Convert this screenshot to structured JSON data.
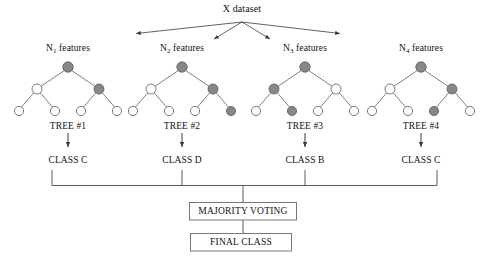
{
  "figure": {
    "title": "X dataset",
    "node_fill_shaded": "#878787",
    "node_fill_empty": "#ffffff",
    "node_stroke": "#5a5a5a",
    "line_color": "#4a4a4a",
    "box_stroke": "#6b6b6b"
  },
  "source": {
    "label": "X dataset",
    "x": 242,
    "y": 11
  },
  "trees": [
    {
      "id": "tree-1",
      "features_label": "N",
      "features_sub": "1",
      "features_suffix": " features",
      "features_x": 68,
      "tree_label": "TREE #1",
      "class_label": "CLASS C",
      "center_x": 68,
      "nodes": {
        "root": "shaded",
        "left": "empty",
        "right": "shaded",
        "leaves": [
          "empty",
          "empty",
          "empty",
          "empty"
        ]
      }
    },
    {
      "id": "tree-2",
      "features_label": "N",
      "features_sub": "2",
      "features_suffix": " features",
      "features_x": 182,
      "tree_label": "TREE #2",
      "class_label": "CLASS D",
      "center_x": 182,
      "nodes": {
        "root": "shaded",
        "left": "empty",
        "right": "shaded",
        "leaves": [
          "empty",
          "empty",
          "empty",
          "shaded"
        ]
      }
    },
    {
      "id": "tree-3",
      "features_label": "N",
      "features_sub": "3",
      "features_suffix": " features",
      "features_x": 305,
      "tree_label": "TREE #3",
      "class_label": "CLASS B",
      "center_x": 305,
      "nodes": {
        "root": "shaded",
        "left": "shaded",
        "right": "empty",
        "leaves": [
          "empty",
          "shaded",
          "empty",
          "empty"
        ]
      }
    },
    {
      "id": "tree-4",
      "features_label": "N",
      "features_sub": "4",
      "features_suffix": " features",
      "features_x": 421,
      "tree_label": "TREE #4",
      "class_label": "CLASS C",
      "center_x": 421,
      "nodes": {
        "root": "shaded",
        "left": "empty",
        "right": "shaded",
        "leaves": [
          "empty",
          "empty",
          "shaded",
          "empty"
        ]
      }
    }
  ],
  "aggregation": {
    "voting_label": "MAJORITY VOTING",
    "final_label": "FINAL CLASS"
  }
}
